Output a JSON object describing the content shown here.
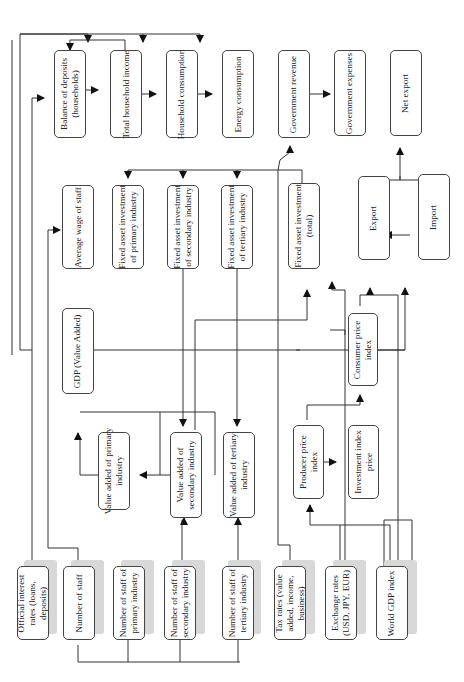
{
  "diagram": {
    "orientation": "rotated-90-ccw",
    "nodes": {
      "official_interest_rates": "Official interest\nrates (loans,\ndeposits)",
      "number_of_staff": "Number of staff",
      "staff_primary": "Number of staff of\nprimary industry",
      "staff_secondary": "Number of staff of\nsecondary industry",
      "staff_tertiary": "Number of staff of\ntertiary industry",
      "tax_rates": "Tax rates (value\nadded, income,\nbusiness)",
      "exchange_rates": "Exchange rates\n(USD, JPY, EUR)",
      "world_gdp": "World GDP index",
      "va_primary": "Value added of primary\nindustry",
      "va_secondary": "Value added of\nsecondary industry",
      "va_tertiary": "Value added of tertiary\nindustry",
      "producer_price": "Producer price\nindex",
      "investment_price": "Investment index\nprice",
      "gdp": "GDP (Value Added)",
      "consumer_price": "Consumer price\nindex",
      "avg_wage": "Average wage of staff",
      "fai_primary": "Fixed asset investment\nof primary industry",
      "fai_secondary": "Fixed asset investment\nof secondary industry",
      "fai_tertiary": "Fixed asset investment\nof tertiary industry",
      "fai_total": "Fixed asset investment\n(total)",
      "export": "Export",
      "import": "Import",
      "balance_deposits": "Balance of deposits\n(households)",
      "household_income": "Total household income",
      "household_consumption": "Household consumption",
      "energy_consumption": "Energy consumption",
      "gov_revenue": "Government revenue",
      "gov_expenses": "Government expenses",
      "net_export": "Net export"
    },
    "edges": [
      [
        "number_of_staff",
        "staff_primary"
      ],
      [
        "number_of_staff",
        "staff_secondary"
      ],
      [
        "number_of_staff",
        "staff_tertiary"
      ],
      [
        "staff_secondary",
        "va_secondary"
      ],
      [
        "staff_tertiary",
        "va_tertiary"
      ],
      [
        "va_secondary",
        "va_primary"
      ],
      [
        "va_primary",
        "gdp"
      ],
      [
        "va_secondary",
        "gdp"
      ],
      [
        "va_tertiary",
        "gdp"
      ],
      [
        "gdp",
        "avg_wage"
      ],
      [
        "gdp",
        "consumer_price"
      ],
      [
        "gdp",
        "energy_consumption"
      ],
      [
        "gdp",
        "gov_revenue"
      ],
      [
        "number_of_staff",
        "avg_wage"
      ],
      [
        "avg_wage",
        "household_income"
      ],
      [
        "official_interest_rates",
        "balance_deposits"
      ],
      [
        "household_income",
        "balance_deposits"
      ],
      [
        "household_income",
        "household_consumption"
      ],
      [
        "household_consumption",
        "energy_consumption"
      ],
      [
        "gov_revenue",
        "gov_expenses"
      ],
      [
        "fai_total",
        "fai_primary"
      ],
      [
        "fai_total",
        "fai_secondary"
      ],
      [
        "fai_total",
        "fai_tertiary"
      ],
      [
        "fai_secondary",
        "va_secondary"
      ],
      [
        "fai_tertiary",
        "va_tertiary"
      ],
      [
        "tax_rates",
        "gov_revenue"
      ],
      [
        "exchange_rates",
        "producer_price"
      ],
      [
        "world_gdp",
        "producer_price"
      ],
      [
        "producer_price",
        "investment_price"
      ],
      [
        "producer_price",
        "consumer_price"
      ],
      [
        "consumer_price",
        "export"
      ],
      [
        "consumer_price",
        "import"
      ],
      [
        "world_gdp",
        "export"
      ],
      [
        "exchange_rates",
        "import"
      ],
      [
        "export",
        "net_export"
      ],
      [
        "import",
        "net_export"
      ]
    ]
  }
}
